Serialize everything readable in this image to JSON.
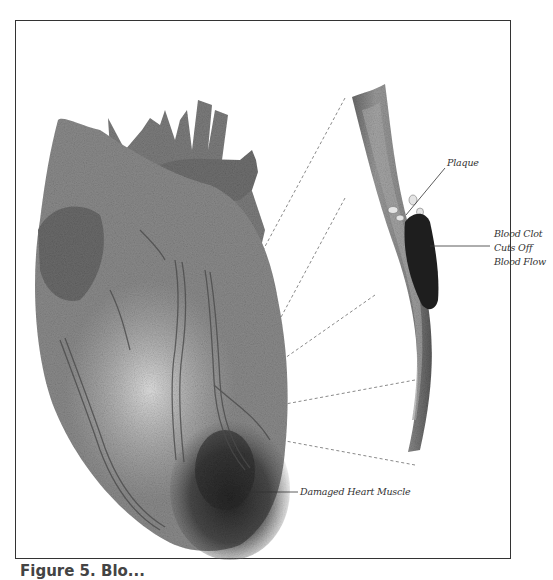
{
  "figure": {
    "type": "medical-illustration",
    "labels": {
      "plaque": "Plaque",
      "blood_clot": "Blood Clot\nCuts Off\nBlood Flow",
      "damaged_muscle": "Damaged Heart Muscle"
    },
    "caption": "Figure 5. Blo..."
  },
  "colors": {
    "frame": "#333333",
    "ink": "#333333",
    "heart_shade": "#7a7a7a",
    "damage_shade": "#2a2a2a",
    "clot": "#1e1e1e",
    "dotted_line": "#888888"
  }
}
